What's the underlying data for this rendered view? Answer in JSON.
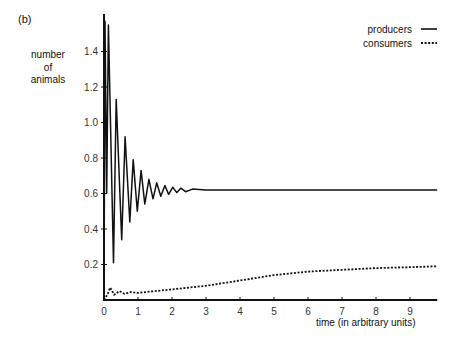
{
  "figure": {
    "panel_label": "(b)",
    "ylabel_lines": [
      "number",
      "of",
      "animals"
    ],
    "xlabel": "time (in arbitrary units)",
    "legend": [
      {
        "label": "producers",
        "style": "solid"
      },
      {
        "label": "consumers",
        "style": "dotted"
      }
    ]
  },
  "chart_data": {
    "type": "line",
    "title": "",
    "xlabel": "time (in arbitrary units)",
    "ylabel": "number of animals",
    "xlim": [
      0,
      9.8
    ],
    "ylim": [
      0,
      1.6
    ],
    "xticks": [
      0,
      1,
      2,
      3,
      4,
      5,
      6,
      7,
      8,
      9
    ],
    "yticks": [
      0.2,
      0.4,
      0.6,
      0.8,
      1.0,
      1.2,
      1.4
    ],
    "ytick_labels": [
      "0.2",
      "0.4",
      "0.6",
      "0.8",
      "1.0",
      "1.2",
      "1.4"
    ],
    "grid": false,
    "legend_position": "upper right",
    "series": [
      {
        "name": "producers",
        "style": "solid",
        "x": [
          0.0,
          0.03,
          0.08,
          0.13,
          0.28,
          0.36,
          0.52,
          0.62,
          0.76,
          0.86,
          0.98,
          1.09,
          1.2,
          1.32,
          1.44,
          1.55,
          1.67,
          1.79,
          1.9,
          2.02,
          2.14,
          2.26,
          2.4,
          2.6,
          3.0,
          5.0,
          7.0,
          9.8
        ],
        "values": [
          0.0,
          1.57,
          0.6,
          1.55,
          0.21,
          1.13,
          0.34,
          0.92,
          0.44,
          0.79,
          0.5,
          0.73,
          0.54,
          0.68,
          0.57,
          0.66,
          0.585,
          0.645,
          0.595,
          0.635,
          0.605,
          0.63,
          0.61,
          0.625,
          0.62,
          0.62,
          0.62,
          0.62
        ]
      },
      {
        "name": "consumers",
        "style": "dotted",
        "x": [
          0.0,
          0.1,
          0.18,
          0.3,
          0.45,
          0.6,
          0.8,
          1.0,
          1.5,
          2.0,
          3.0,
          4.0,
          5.0,
          6.0,
          7.0,
          8.0,
          9.0,
          9.8
        ],
        "values": [
          0.0,
          0.03,
          0.07,
          0.03,
          0.05,
          0.035,
          0.045,
          0.04,
          0.05,
          0.06,
          0.08,
          0.11,
          0.14,
          0.16,
          0.17,
          0.18,
          0.185,
          0.19
        ]
      }
    ]
  }
}
